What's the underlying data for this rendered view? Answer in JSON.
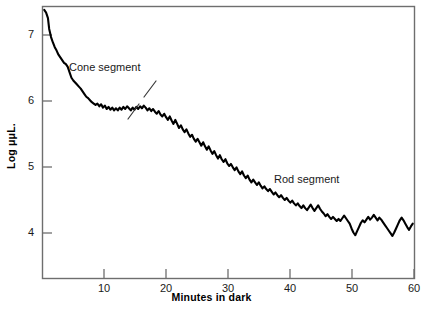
{
  "figure": {
    "background": "#ffffff",
    "frame_color": "#6e6e6e",
    "curve_color": "#000000",
    "width": 423,
    "height": 313
  },
  "axes": {
    "x_title": "Minutes in dark",
    "y_title": "Log μμL.",
    "x_ticks": [
      "10",
      "20",
      "30",
      "40",
      "50",
      "60"
    ],
    "y_ticks": [
      "7",
      "6",
      "5",
      "4"
    ]
  },
  "annotations": {
    "cone": "Cone segment",
    "rod": "Rod segment",
    "divider_icon": "dashed-divider-icon"
  },
  "chart_data": {
    "type": "line",
    "title": "",
    "subtitle": "",
    "xlabel": "Minutes in dark",
    "ylabel": "Log μμL.",
    "xlim": [
      0,
      60
    ],
    "ylim": [
      3.55,
      7.55
    ],
    "xticks": [
      10,
      20,
      30,
      40,
      50,
      60
    ],
    "yticks": [
      7,
      6,
      5,
      4
    ],
    "grid": false,
    "legend": "none",
    "annotations": [
      {
        "text": "Cone segment",
        "x": 5.5,
        "y": 6.62
      },
      {
        "text": "Rod segment",
        "x": 38.0,
        "y": 5.3
      },
      {
        "text": "dashed divider between cone and rod branches",
        "x": 17.5,
        "y": 6.05
      }
    ],
    "series": [
      {
        "name": "Dark adaptation threshold",
        "x": [
          0.2,
          0.5,
          0.8,
          1.0,
          1.3,
          1.6,
          1.9,
          2.2,
          2.5,
          2.8,
          3.1,
          3.4,
          3.7,
          4.0,
          4.3,
          4.6,
          4.9,
          5.2,
          5.5,
          5.8,
          6.1,
          6.4,
          6.7,
          7.0,
          7.3,
          7.6,
          7.9,
          8.2,
          8.5,
          8.8,
          9.1,
          9.4,
          9.7,
          10.0,
          10.3,
          10.6,
          10.9,
          11.2,
          11.5,
          11.8,
          12.1,
          12.4,
          12.7,
          13.0,
          13.3,
          13.6,
          13.9,
          14.2,
          14.5,
          14.8,
          15.1,
          15.4,
          15.7,
          16.0,
          16.3,
          16.6,
          16.9,
          17.2,
          17.5,
          17.8,
          18.1,
          18.4,
          18.7,
          19.0,
          19.3,
          19.6,
          19.9,
          20.2,
          20.5,
          20.8,
          21.1,
          21.4,
          21.7,
          22.0,
          22.3,
          22.6,
          22.9,
          23.2,
          23.5,
          23.8,
          24.1,
          24.4,
          24.7,
          25.0,
          25.3,
          25.6,
          25.9,
          26.2,
          26.5,
          26.8,
          27.1,
          27.4,
          27.7,
          28.0,
          28.3,
          28.6,
          28.9,
          29.2,
          29.5,
          29.8,
          30.1,
          30.4,
          30.7,
          31.0,
          31.3,
          31.6,
          31.9,
          32.2,
          32.5,
          32.8,
          33.1,
          33.4,
          33.7,
          34.0,
          34.3,
          34.6,
          34.9,
          35.2,
          35.5,
          35.8,
          36.1,
          36.4,
          36.7,
          37.0,
          37.3,
          37.6,
          37.9,
          38.2,
          38.5,
          38.8,
          39.1,
          39.4,
          39.7,
          40.0,
          40.3,
          40.6,
          40.9,
          41.2,
          41.5,
          41.8,
          42.1,
          42.4,
          42.7,
          43.0,
          43.3,
          43.6,
          43.9,
          44.2,
          44.5,
          44.8,
          45.1,
          45.4,
          45.7,
          46.0,
          46.3,
          46.6,
          46.9,
          47.2,
          47.5,
          47.8,
          48.1,
          48.4,
          48.7,
          49.0,
          49.3,
          49.6,
          49.9,
          50.2,
          50.5,
          50.8,
          51.1,
          51.4,
          51.7,
          52.0,
          52.3,
          52.6,
          52.9,
          53.2,
          53.5,
          53.8,
          54.1,
          54.4,
          54.7,
          55.0,
          55.3,
          55.6,
          55.9,
          56.2,
          56.5,
          56.8,
          57.1,
          57.4,
          57.7,
          58.0,
          58.3,
          58.6,
          58.9,
          59.2,
          59.5,
          59.8
        ],
        "y": [
          7.5,
          7.46,
          7.38,
          7.22,
          7.1,
          7.02,
          6.95,
          6.9,
          6.84,
          6.8,
          6.76,
          6.72,
          6.7,
          6.66,
          6.58,
          6.5,
          6.46,
          6.43,
          6.4,
          6.37,
          6.34,
          6.3,
          6.26,
          6.22,
          6.2,
          6.17,
          6.14,
          6.12,
          6.1,
          6.12,
          6.08,
          6.11,
          6.06,
          6.09,
          6.04,
          6.07,
          6.03,
          6.06,
          6.02,
          6.05,
          6.02,
          6.06,
          6.03,
          6.07,
          6.04,
          6.08,
          6.05,
          6.02,
          6.06,
          6.03,
          6.07,
          6.04,
          6.08,
          6.05,
          6.09,
          6.06,
          6.02,
          6.05,
          6.01,
          6.04,
          6.0,
          5.97,
          6.01,
          5.96,
          5.93,
          5.97,
          5.92,
          5.88,
          5.93,
          5.87,
          5.82,
          5.88,
          5.82,
          5.76,
          5.8,
          5.74,
          5.7,
          5.74,
          5.68,
          5.63,
          5.66,
          5.6,
          5.56,
          5.6,
          5.55,
          5.5,
          5.55,
          5.49,
          5.44,
          5.49,
          5.43,
          5.38,
          5.42,
          5.36,
          5.31,
          5.36,
          5.3,
          5.26,
          5.3,
          5.24,
          5.2,
          5.23,
          5.18,
          5.14,
          5.18,
          5.12,
          5.08,
          5.12,
          5.06,
          5.02,
          5.06,
          5.0,
          4.96,
          5.0,
          4.96,
          4.92,
          4.96,
          4.91,
          4.87,
          4.9,
          4.86,
          4.83,
          4.86,
          4.82,
          4.78,
          4.81,
          4.77,
          4.74,
          4.77,
          4.73,
          4.7,
          4.73,
          4.69,
          4.66,
          4.69,
          4.65,
          4.62,
          4.65,
          4.61,
          4.58,
          4.62,
          4.58,
          4.55,
          4.59,
          4.63,
          4.58,
          4.54,
          4.58,
          4.62,
          4.57,
          4.53,
          4.5,
          4.46,
          4.49,
          4.45,
          4.42,
          4.45,
          4.42,
          4.39,
          4.42,
          4.39,
          4.43,
          4.47,
          4.43,
          4.39,
          4.35,
          4.28,
          4.22,
          4.18,
          4.24,
          4.3,
          4.36,
          4.4,
          4.37,
          4.41,
          4.45,
          4.41,
          4.44,
          4.48,
          4.44,
          4.4,
          4.44,
          4.41,
          4.37,
          4.33,
          4.29,
          4.25,
          4.21,
          4.17,
          4.22,
          4.28,
          4.34,
          4.4,
          4.44,
          4.4,
          4.35,
          4.3,
          4.26,
          4.31,
          4.35
        ]
      }
    ]
  }
}
